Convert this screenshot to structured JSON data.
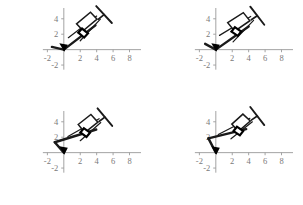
{
  "figure": {
    "title": "",
    "panel_count": 4,
    "layout": "2x2 grid of mechanism position plots",
    "background_color": "#ffffff",
    "axis_color": "#9a9a9a",
    "tick_label_color": "#7a7a7a",
    "link_color": "#1a1a1a",
    "ground_color": "#000000"
  },
  "axes": {
    "xlabel": "",
    "ylabel": "",
    "xlim": [
      -2.9,
      9.4
    ],
    "ylim": [
      -2.9,
      5.4
    ],
    "x_ticks": [
      -2,
      2,
      4,
      6,
      8
    ],
    "y_ticks": [
      4,
      2,
      -2
    ],
    "x_tick_labels": [
      "-2",
      "2",
      "4",
      "6",
      "8"
    ],
    "y_tick_labels": [
      "4",
      "2",
      "-2"
    ],
    "grid": false,
    "legend": "none"
  },
  "chart_data": {
    "type": "line",
    "title": "",
    "xlabel": "",
    "ylabel": "",
    "xlim": [
      -2.9,
      9.4
    ],
    "ylim": [
      -2.9,
      5.4
    ],
    "grid": false,
    "legend": "none",
    "x_ticks": [
      -2,
      2,
      4,
      6,
      8
    ],
    "y_ticks": [
      -2,
      2,
      4
    ],
    "panels": [
      {
        "name": "panel-top-left",
        "position_index": 1,
        "ground_pivot": [
          0,
          0
        ],
        "crank_tip": [
          -1.45,
          0.35
        ],
        "series": [
          {
            "name": "crank-link",
            "x": [
              -1.45,
              0.0
            ],
            "y": [
              0.35,
              0.0
            ]
          },
          {
            "name": "coupler-link",
            "x": [
              0.0,
              3.85
            ],
            "y": [
              0.0,
              3.15
            ]
          },
          {
            "name": "barrel-axis",
            "x": [
              0.55,
              4.0
            ],
            "y": [
              1.55,
              4.35
            ]
          },
          {
            "name": "plunger-rod",
            "x": [
              2.0,
              4.45
            ],
            "y": [
              1.15,
              3.95
            ]
          }
        ],
        "barrel": {
          "corner_1": [
            1.55,
            3.35
          ],
          "corner_2": [
            3.25,
            4.85
          ],
          "corner_3": [
            4.05,
            3.95
          ],
          "corner_4": [
            2.35,
            2.45
          ],
          "angle_deg": 41
        },
        "plunger_handle": {
          "center": [
            4.9,
            4.55
          ],
          "angle_deg": 41
        },
        "slider_block": {
          "center": [
            2.35,
            2.15
          ],
          "angle_deg": 41
        },
        "values": [
          0.35,
          0.0,
          3.15,
          4.35
        ]
      },
      {
        "name": "panel-top-right",
        "position_index": 2,
        "ground_pivot": [
          0,
          0
        ],
        "crank_tip": [
          -1.3,
          0.75
        ],
        "series": [
          {
            "name": "crank-link",
            "x": [
              -1.3,
              0.0
            ],
            "y": [
              0.75,
              0.0
            ]
          },
          {
            "name": "coupler-link",
            "x": [
              0.0,
              4.0
            ],
            "y": [
              0.0,
              3.0
            ]
          },
          {
            "name": "barrel-axis",
            "x": [
              0.45,
              4.25
            ],
            "y": [
              1.85,
              4.3
            ]
          },
          {
            "name": "plunger-rod",
            "x": [
              2.1,
              4.6
            ],
            "y": [
              1.0,
              3.8
            ]
          }
        ],
        "barrel": {
          "corner_1": [
            1.45,
            3.5
          ],
          "corner_2": [
            3.35,
            4.8
          ],
          "corner_3": [
            4.15,
            3.75
          ],
          "corner_4": [
            2.3,
            2.4
          ],
          "angle_deg": 36
        },
        "plunger_handle": {
          "center": [
            5.05,
            4.4
          ],
          "angle_deg": 36
        },
        "slider_block": {
          "center": [
            2.5,
            2.35
          ],
          "angle_deg": 36
        },
        "values": [
          0.75,
          0.0,
          3.0,
          4.3
        ]
      },
      {
        "name": "panel-bottom-left",
        "position_index": 3,
        "ground_pivot": [
          0,
          0
        ],
        "crank_tip": [
          -1.1,
          1.35
        ],
        "series": [
          {
            "name": "crank-link",
            "x": [
              -1.1,
              0.0
            ],
            "y": [
              1.35,
              0.0
            ]
          },
          {
            "name": "coupler-link",
            "x": [
              -1.1,
              3.95
            ],
            "y": [
              1.35,
              3.0
            ]
          },
          {
            "name": "barrel-axis",
            "x": [
              0.5,
              4.3
            ],
            "y": [
              2.1,
              4.4
            ]
          },
          {
            "name": "plunger-rod",
            "x": [
              2.0,
              4.5
            ],
            "y": [
              1.55,
              3.9
            ]
          }
        ],
        "barrel": {
          "corner_1": [
            1.75,
            3.65
          ],
          "corner_2": [
            3.3,
            4.95
          ],
          "corner_3": [
            4.15,
            3.95
          ],
          "corner_4": [
            2.55,
            2.6
          ],
          "angle_deg": 38
        },
        "plunger_handle": {
          "center": [
            5.0,
            4.6
          ],
          "angle_deg": 38
        },
        "slider_block": {
          "center": [
            2.6,
            2.6
          ],
          "angle_deg": 38
        },
        "values": [
          1.35,
          0.0,
          3.0,
          4.4
        ]
      },
      {
        "name": "panel-bottom-right",
        "position_index": 4,
        "ground_pivot": [
          0,
          0
        ],
        "crank_tip": [
          -0.9,
          1.85
        ],
        "series": [
          {
            "name": "crank-link",
            "x": [
              -0.9,
              0.0
            ],
            "y": [
              1.85,
              0.0
            ]
          },
          {
            "name": "coupler-link",
            "x": [
              -0.9,
              3.7
            ],
            "y": [
              1.85,
              3.05
            ]
          },
          {
            "name": "barrel-axis",
            "x": [
              0.3,
              4.15
            ],
            "y": [
              2.35,
              4.45
            ]
          },
          {
            "name": "plunger-rod",
            "x": [
              1.85,
              4.45
            ],
            "y": [
              1.8,
              4.0
            ]
          }
        ],
        "barrel": {
          "corner_1": [
            1.95,
            3.7
          ],
          "corner_2": [
            3.3,
            5.0
          ],
          "corner_3": [
            4.2,
            4.1
          ],
          "corner_4": [
            2.75,
            2.75
          ],
          "angle_deg": 36
        },
        "plunger_handle": {
          "center": [
            5.05,
            4.75
          ],
          "angle_deg": 36
        },
        "slider_block": {
          "center": [
            2.75,
            2.8
          ],
          "angle_deg": 36
        },
        "values": [
          1.85,
          0.0,
          3.05,
          4.45
        ]
      }
    ]
  }
}
